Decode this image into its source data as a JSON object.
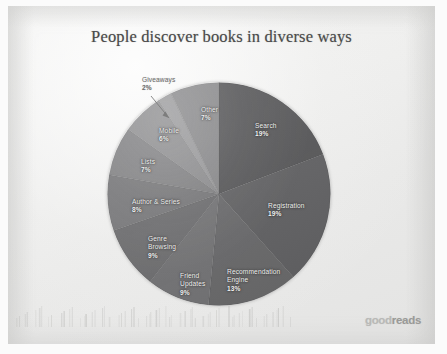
{
  "slide": {
    "title": "People discover books in diverse ways",
    "brand_light": "good",
    "brand_bold": "reads",
    "background_color": "#eeeeed",
    "title_color": "#4a4a4a",
    "label_color": "#f2f2f2",
    "callout_color": "#6e6e6e"
  },
  "chart_data": {
    "type": "pie",
    "title": "People discover books in diverse ways",
    "xlabel": "",
    "ylabel": "",
    "legend_position": "none",
    "grid": false,
    "units": "percent",
    "start_angle_deg": 0,
    "direction": "clockwise",
    "categories": [
      "Search",
      "Registration",
      "Recommendation Engine",
      "Friend Updates",
      "Genre Browsing",
      "Author & Series",
      "Lists",
      "Mobile",
      "Giveaways",
      "Other"
    ],
    "values": [
      19,
      19,
      13,
      9,
      9,
      8,
      7,
      6,
      2,
      7
    ],
    "slices": [
      {
        "label": "Search",
        "value": 19,
        "pct_text": "19%",
        "color": "#58585a",
        "label_placement": "inside",
        "label_x": 148,
        "label_y": 40
      },
      {
        "label": "Registration",
        "value": 19,
        "pct_text": "19%",
        "color": "#636365",
        "label_placement": "inside",
        "label_x": 161,
        "label_y": 120
      },
      {
        "label": "Recommendation Engine",
        "value": 13,
        "pct_text": "13%",
        "color": "#6b6b6d",
        "label_placement": "inside",
        "label_x": 120,
        "label_y": 186
      },
      {
        "label": "Friend Updates",
        "value": 9,
        "pct_text": "9%",
        "color": "#757577",
        "label_placement": "inside",
        "label_x": 73,
        "label_y": 190
      },
      {
        "label": "Genre Browsing",
        "value": 9,
        "pct_text": "9%",
        "color": "#6f6f71",
        "label_placement": "inside",
        "label_x": 41,
        "label_y": 153
      },
      {
        "label": "Author & Series",
        "value": 8,
        "pct_text": "8%",
        "color": "#79797b",
        "label_placement": "inside",
        "label_x": 25,
        "label_y": 116
      },
      {
        "label": "Lists",
        "value": 7,
        "pct_text": "7%",
        "color": "#838385",
        "label_placement": "inside",
        "label_x": 34,
        "label_y": 76
      },
      {
        "label": "Mobile",
        "value": 6,
        "pct_text": "6%",
        "color": "#8f8f91",
        "label_placement": "inside",
        "label_x": 52,
        "label_y": 45
      },
      {
        "label": "Giveaways",
        "value": 2,
        "pct_text": "2%",
        "color": "#9b9b9d",
        "label_placement": "callout",
        "label_x": 35,
        "label_y": -6
      },
      {
        "label": "Other",
        "value": 7,
        "pct_text": "7%",
        "color": "#8a8a8c",
        "label_placement": "inside",
        "label_x": 94,
        "label_y": 24
      }
    ]
  }
}
